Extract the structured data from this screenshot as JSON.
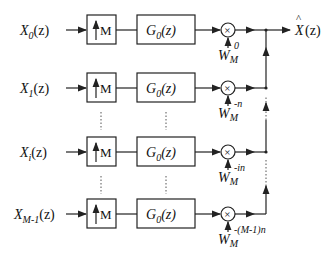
{
  "diagram": {
    "rows": [
      {
        "input_label": "X",
        "input_sub": "0",
        "upsampler_label": "M",
        "filter_label": "G",
        "filter_sub": "0",
        "twiddle_base": "W",
        "twiddle_sub": "M",
        "twiddle_exp": "0"
      },
      {
        "input_label": "X",
        "input_sub": "1",
        "upsampler_label": "M",
        "filter_label": "G",
        "filter_sub": "0",
        "twiddle_base": "W",
        "twiddle_sub": "M",
        "twiddle_exp": "-n"
      },
      {
        "input_label": "X",
        "input_sub": "i",
        "upsampler_label": "M",
        "filter_label": "G",
        "filter_sub": "0",
        "twiddle_base": "W",
        "twiddle_sub": "M",
        "twiddle_exp": "-in"
      },
      {
        "input_label": "X",
        "input_sub": "M-1",
        "upsampler_label": "M",
        "filter_label": "G",
        "filter_sub": "0",
        "twiddle_base": "W",
        "twiddle_sub": "M",
        "twiddle_exp": "-(M-1)n"
      }
    ],
    "arg": "(z)",
    "multiplier_symbol": "×",
    "output": {
      "label": "X",
      "hat": "^",
      "arg": "(z)"
    }
  }
}
